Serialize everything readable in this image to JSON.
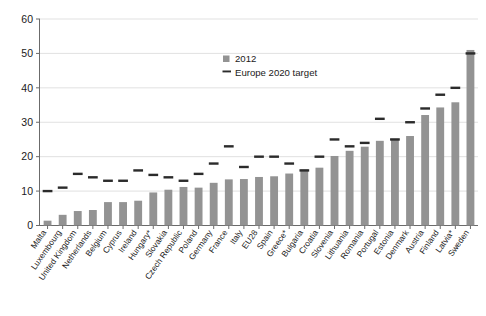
{
  "chart_data": {
    "type": "bar",
    "title": "",
    "xlabel": "",
    "ylabel": "",
    "ylim": [
      0,
      60
    ],
    "yticks": [
      0,
      10,
      20,
      30,
      40,
      50,
      60
    ],
    "grid": true,
    "legend_position": "top-right",
    "categories": [
      "Malta",
      "Luxembourg",
      "United Kingdom",
      "Netherlands",
      "Belgium",
      "Cyprus",
      "Ireland",
      "Hungary*",
      "Slovakia",
      "Czech Republic",
      "Poland",
      "Germany",
      "France",
      "Italy",
      "EU28",
      "Spain",
      "Greece*",
      "Bulgaria",
      "Croatia",
      "Slovenia",
      "Lithuania",
      "Romania",
      "Portugal",
      "Estonia",
      "Denmark",
      "Austria",
      "Finland",
      "Latvia*",
      "Sweden"
    ],
    "series": [
      {
        "name": "2012",
        "type": "bar",
        "color": "#939393",
        "values": [
          1.4,
          3.1,
          4.2,
          4.5,
          6.8,
          6.8,
          7.2,
          9.6,
          10.4,
          11.2,
          11.0,
          12.4,
          13.4,
          13.5,
          14.1,
          14.3,
          15.1,
          16.3,
          16.8,
          20.2,
          21.7,
          22.9,
          24.6,
          25.2,
          26.0,
          32.1,
          34.3,
          35.8,
          51.0
        ]
      },
      {
        "name": "Europe 2020 target",
        "type": "marker-dash",
        "color": "#2b2b2b",
        "values": [
          10.0,
          11.0,
          15.0,
          14.0,
          13.0,
          13.0,
          16.0,
          14.7,
          14.0,
          13.0,
          15.0,
          18.0,
          23.0,
          17.0,
          20.0,
          20.0,
          18.0,
          16.0,
          20.0,
          25.0,
          23.0,
          24.0,
          31.0,
          25.0,
          30.0,
          34.0,
          38.0,
          40.0,
          50.0
        ]
      }
    ]
  },
  "legend": {
    "items": [
      {
        "label": "2012",
        "marker": "square-marker",
        "color": "#939393"
      },
      {
        "label": "Europe 2020 target",
        "marker": "dash-marker",
        "color": "#2b2b2b"
      }
    ]
  }
}
